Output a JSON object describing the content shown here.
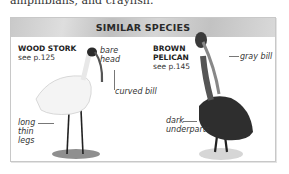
{
  "body_text": "amphibians, and crayfish.",
  "panel": {
    "title": "SIMILAR SPECIES",
    "species": [
      {
        "name": "WOOD STORK",
        "ref": "see p.125",
        "callouts": [
          "bare head",
          "curved bill",
          "long thin legs"
        ]
      },
      {
        "name_line1": "BROWN",
        "name_line2": "PELICAN",
        "ref": "see p.145",
        "callouts": [
          "gray bill",
          "dark underparts"
        ]
      }
    ]
  },
  "labels": {
    "bare": "bare",
    "head": "head",
    "curved_bill": "curved bill",
    "long": "long",
    "thin": "thin",
    "legs": "legs",
    "gray_bill": "gray bill",
    "dark": "dark",
    "underparts": "underparts"
  },
  "colors": {
    "header_band": "#c9c9c9",
    "border": "#c8c8c8",
    "text": "#222222"
  }
}
